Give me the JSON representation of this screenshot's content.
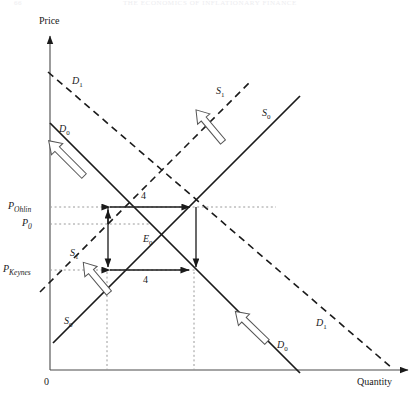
{
  "page": {
    "running_head": "THE ECONOMICS OF INFLATIONARY FINANCE",
    "page_number": "66"
  },
  "axes": {
    "y_label": "Price",
    "x_label": "Quantity",
    "origin_label": "0"
  },
  "curves": [
    {
      "id": "D1_upper",
      "label": "D",
      "sub": "1",
      "x": 72,
      "y": 76,
      "style": "dashed",
      "kind": "demand"
    },
    {
      "id": "D0_upper",
      "label": "D",
      "sub": "0",
      "x": 59,
      "y": 124,
      "style": "solid",
      "kind": "demand"
    },
    {
      "id": "S1_upper",
      "label": "S",
      "sub": "1",
      "x": 216,
      "y": 86,
      "style": "dashed",
      "kind": "supply"
    },
    {
      "id": "S0_upper",
      "label": "S",
      "sub": "0",
      "x": 262,
      "y": 108,
      "style": "solid",
      "kind": "supply"
    },
    {
      "id": "S1_lower",
      "label": "S",
      "sub": "1",
      "x": 70,
      "y": 248,
      "style": "dashed",
      "kind": "supply"
    },
    {
      "id": "S0_lower",
      "label": "S",
      "sub": "0",
      "x": 64,
      "y": 316,
      "style": "solid",
      "kind": "supply"
    },
    {
      "id": "D1_lower",
      "label": "D",
      "sub": "1",
      "x": 316,
      "y": 318,
      "style": "dashed",
      "kind": "demand"
    },
    {
      "id": "D0_lower",
      "label": "D",
      "sub": "0",
      "x": 277,
      "y": 340,
      "style": "solid",
      "kind": "demand"
    }
  ],
  "price_marks": [
    {
      "id": "p_ohlin",
      "label": "P",
      "sub": "Ohlin",
      "x": 8,
      "y": 201,
      "level": 207
    },
    {
      "id": "p_zero",
      "label": "P",
      "sub": "0",
      "x": 22,
      "y": 218,
      "level": 224
    },
    {
      "id": "p_keynes",
      "label": "P",
      "sub": "Keynes",
      "x": 3,
      "y": 264,
      "level": 270
    }
  ],
  "equilibrium": {
    "label": "E",
    "sub": "0",
    "x": 143,
    "y": 234
  },
  "quantity_gaps": [
    {
      "id": "gap_upper",
      "value": "4",
      "x": 141,
      "y": 191,
      "from_x": 107,
      "to_x": 192,
      "level": 207
    },
    {
      "id": "gap_lower",
      "value": "4",
      "x": 143,
      "y": 275,
      "from_x": 108,
      "to_x": 191,
      "level": 270
    }
  ],
  "shift_arrows": [
    {
      "id": "demand-shift-upper",
      "from": "D0",
      "to": "D1",
      "direction": "up-right"
    },
    {
      "id": "supply-shift-upper",
      "from": "S0",
      "to": "S1",
      "direction": "up-left"
    },
    {
      "id": "supply-shift-lower",
      "from": "S0",
      "to": "S1",
      "direction": "up-left"
    },
    {
      "id": "demand-shift-lower",
      "from": "D0",
      "to": "D1",
      "direction": "up-right"
    }
  ],
  "colors": {
    "ink": "#1a1a1a",
    "axis": "#4a4a4a",
    "dotted_guide": "#9a9a9a",
    "header_faint": "#ededf0"
  }
}
